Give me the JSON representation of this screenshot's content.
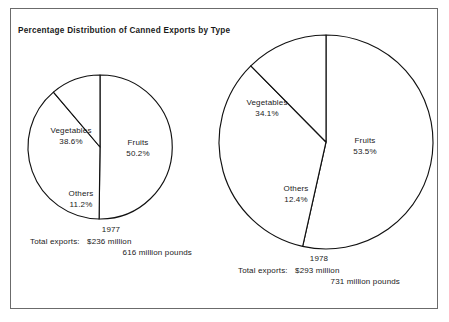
{
  "figure": {
    "title": "Percentage Distribution of Canned Exports by Type",
    "background_color": "#ffffff",
    "frame_color": "#6b6b6b",
    "line_color": "#111111",
    "text_color": "#1a1a1a"
  },
  "pies": [
    {
      "year": "1977",
      "totals_label": "Total exports:",
      "totals_money": "$236 million",
      "totals_weight": "616 million pounds",
      "slices": [
        {
          "label": "Fruits",
          "pct_text": "50.2%"
        },
        {
          "label": "Vegetables",
          "pct_text": "38.6%"
        },
        {
          "label": "Others",
          "pct_text": "11.2%"
        }
      ]
    },
    {
      "year": "1978",
      "totals_label": "Total exports:",
      "totals_money": "$293 million",
      "totals_weight": "731 million pounds",
      "slices": [
        {
          "label": "Fruits",
          "pct_text": "53.5%"
        },
        {
          "label": "Vegetables",
          "pct_text": "34.1%"
        },
        {
          "label": "Others",
          "pct_text": "12.4%"
        }
      ]
    }
  ],
  "chart_data": {
    "type": "pie",
    "title": "Percentage Distribution of Canned Exports by Type",
    "xlabel": "",
    "ylabel": "",
    "legend": "none",
    "grid": false,
    "units": "percent",
    "charts": [
      {
        "name": "1977",
        "labels": [
          "Fruits",
          "Vegetables",
          "Others"
        ],
        "values": [
          50.2,
          38.6,
          11.2
        ],
        "total_exports_dollars_million": 236,
        "total_exports_pounds_million": 616,
        "annotations": [
          "1977",
          "Total exports:  $236 million",
          "616 million pounds"
        ]
      },
      {
        "name": "1978",
        "labels": [
          "Fruits",
          "Vegetables",
          "Others"
        ],
        "values": [
          53.5,
          34.1,
          12.4
        ],
        "total_exports_dollars_million": 293,
        "total_exports_pounds_million": 731,
        "annotations": [
          "1978",
          "Total exports:  $293 million",
          "731 million pounds"
        ]
      }
    ]
  }
}
